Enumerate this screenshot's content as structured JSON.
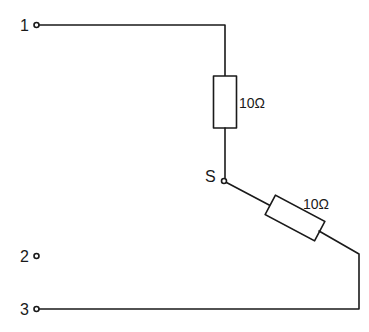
{
  "diagram": {
    "type": "circuit schematic",
    "terminals": [
      {
        "id": "1",
        "label": "1"
      },
      {
        "id": "2",
        "label": "2"
      },
      {
        "id": "3",
        "label": "3"
      }
    ],
    "node": {
      "label": "S"
    },
    "resistors": [
      {
        "id": "R1",
        "label": "10Ω",
        "orientation": "vertical",
        "between": [
          "1",
          "S"
        ]
      },
      {
        "id": "R2",
        "label": "10Ω",
        "orientation": "diagonal",
        "between": [
          "S",
          "3"
        ]
      }
    ],
    "colors": {
      "line": "#1a1a1a",
      "background": "#ffffff"
    }
  }
}
